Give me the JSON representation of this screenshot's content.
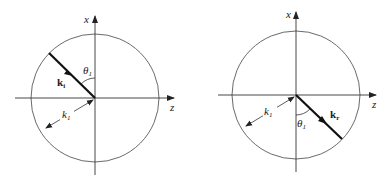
{
  "diagrams": [
    {
      "name": "incident-wavevector-diagram",
      "axis_x_label": "x",
      "axis_z_label": "z",
      "vector_label": "k",
      "vector_subscript": "i",
      "radius_label": "k",
      "radius_subscript": "1",
      "angle_label": "θ",
      "angle_subscript": "1"
    },
    {
      "name": "reflected-wavevector-diagram",
      "axis_x_label": "x",
      "axis_z_label": "z",
      "vector_label": "k",
      "vector_subscript": "r",
      "radius_label": "k",
      "radius_subscript": "1",
      "angle_label": "θ",
      "angle_subscript": "1"
    }
  ],
  "colors": {
    "line": "#333333",
    "vector": "#111111",
    "background": "#ffffff"
  }
}
